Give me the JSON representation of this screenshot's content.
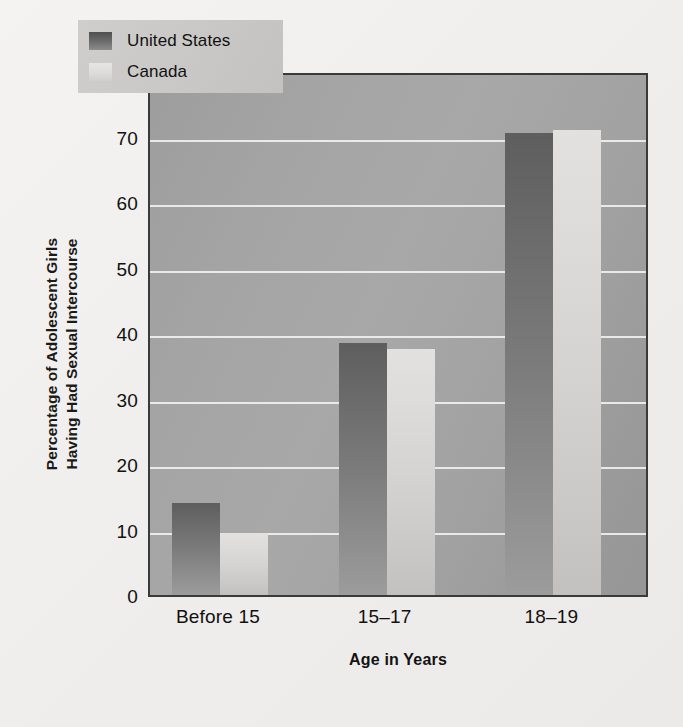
{
  "chart_data": {
    "type": "bar",
    "title": "",
    "xlabel": "Age in Years",
    "ylabel": "Percentage of Adolescent Girls Having Had Sexual Intercourse",
    "ylabel_lines": [
      "Percentage of Adolescent Girls",
      "Having Had Sexual Intercourse"
    ],
    "categories": [
      "Before 15",
      "15–17",
      "18–19"
    ],
    "series": [
      {
        "name": "United States",
        "values": [
          14,
          38.5,
          70.5
        ],
        "color": "#6e6e6e"
      },
      {
        "name": "Canada",
        "values": [
          9.5,
          37.5,
          71
        ],
        "color": "#d9d8d6"
      }
    ],
    "ylim": [
      0,
      80
    ],
    "ytick_labels": [
      "0",
      "10",
      "20",
      "30",
      "40",
      "50",
      "60",
      "70",
      "80"
    ],
    "ytick_values": [
      0,
      10,
      20,
      30,
      40,
      50,
      60,
      70,
      80
    ],
    "grid": true,
    "grid_color": "#f0efed",
    "legend_position": "upper left",
    "plot_background": "#a3a3a3",
    "figure_background": "#f1f0ee",
    "border_color": "#3a3a3a"
  },
  "legend": {
    "entries": [
      {
        "label": "United States",
        "swatch": "us"
      },
      {
        "label": "Canada",
        "swatch": "ca"
      }
    ]
  }
}
